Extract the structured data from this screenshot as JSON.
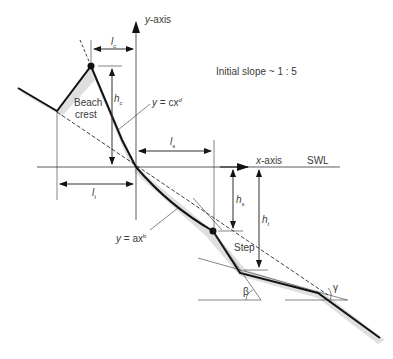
{
  "figure": {
    "title_note": "Initial slope ~ 1 : 5",
    "axes": {
      "y_axis_label": "y-axis",
      "x_axis_label": "x-axis",
      "water_level_label": "SWL"
    },
    "labels": {
      "beach_crest_line1": "Beach",
      "beach_crest_line2": "crest",
      "step": "Step",
      "crest_curve_eq": "y = cx",
      "crest_curve_exp": "d",
      "step_curve_eq": "y = ax",
      "step_curve_exp": "b",
      "lc": "l",
      "lc_sub": "c",
      "hc": "h",
      "hc_sub": "c",
      "ls": "l",
      "ls_sub": "s",
      "lt": "l",
      "lt_sub": "t",
      "hs": "h",
      "hs_sub": "s",
      "ht": "h",
      "ht_sub": "t",
      "beta": "β",
      "gamma": "γ"
    },
    "colors": {
      "line": "#111111",
      "thin": "#333333",
      "shade": "#cfcfcf",
      "text": "#3a3a3a"
    }
  }
}
